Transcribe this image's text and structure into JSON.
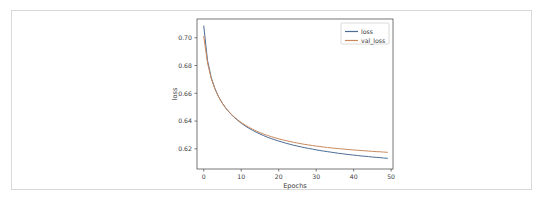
{
  "chart_data": {
    "type": "line",
    "title": "",
    "xlabel": "Epochs",
    "ylabel": "loss",
    "xlim": [
      -1.8,
      50.5
    ],
    "ylim": [
      0.6055,
      0.7135
    ],
    "grid": false,
    "legend_position": "upper right",
    "xticks": [
      "0",
      "10",
      "20",
      "30",
      "40",
      "50"
    ],
    "xtick_values": [
      0,
      10,
      20,
      30,
      40,
      50
    ],
    "yticks": [
      "0.62",
      "0.64",
      "0.66",
      "0.68",
      "0.70"
    ],
    "ytick_values": [
      0.62,
      0.64,
      0.66,
      0.68,
      0.7
    ],
    "x": [
      0,
      1,
      2,
      3,
      4,
      5,
      6,
      7,
      8,
      9,
      10,
      11,
      12,
      13,
      14,
      15,
      16,
      17,
      18,
      19,
      20,
      21,
      22,
      23,
      24,
      25,
      26,
      27,
      28,
      29,
      30,
      31,
      32,
      33,
      34,
      35,
      36,
      37,
      38,
      39,
      40,
      41,
      42,
      43,
      44,
      45,
      46,
      47,
      48,
      49
    ],
    "series": [
      {
        "name": "loss",
        "color": "#4c6c94",
        "values": [
          0.7085,
          0.6838,
          0.6713,
          0.6633,
          0.6573,
          0.6527,
          0.6489,
          0.6457,
          0.643,
          0.6406,
          0.6385,
          0.6366,
          0.6349,
          0.6334,
          0.632,
          0.6307,
          0.6295,
          0.6284,
          0.6274,
          0.6265,
          0.6256,
          0.6248,
          0.624,
          0.6233,
          0.6226,
          0.622,
          0.6214,
          0.6208,
          0.6203,
          0.6198,
          0.6193,
          0.6188,
          0.6184,
          0.618,
          0.6176,
          0.6172,
          0.6168,
          0.6165,
          0.6161,
          0.6158,
          0.6155,
          0.6152,
          0.6149,
          0.6147,
          0.6144,
          0.6141,
          0.6139,
          0.6137,
          0.6134,
          0.6132
        ]
      },
      {
        "name": "val_loss",
        "color": "#c98a5e",
        "values": [
          0.701,
          0.682,
          0.6706,
          0.6629,
          0.6572,
          0.6527,
          0.649,
          0.6459,
          0.6433,
          0.641,
          0.639,
          0.6372,
          0.6356,
          0.6342,
          0.6329,
          0.6317,
          0.6306,
          0.6297,
          0.6288,
          0.628,
          0.6272,
          0.6265,
          0.6259,
          0.6253,
          0.6247,
          0.6242,
          0.6237,
          0.6232,
          0.6228,
          0.6224,
          0.622,
          0.6217,
          0.6213,
          0.621,
          0.6207,
          0.6204,
          0.6202,
          0.6199,
          0.6197,
          0.6194,
          0.6192,
          0.619,
          0.6188,
          0.6186,
          0.6184,
          0.6182,
          0.618,
          0.6179,
          0.6177,
          0.6175
        ]
      }
    ]
  },
  "caption": {
    "sliver_text": ""
  }
}
